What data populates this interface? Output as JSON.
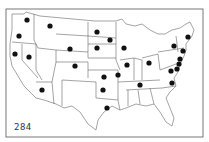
{
  "map": {
    "title": "",
    "figure_number": "284",
    "frame": {
      "x": 6,
      "y": 9,
      "w": 197,
      "h": 128
    },
    "colors": {
      "line": "#555555",
      "dot": "#111111",
      "background": "#ffffff"
    },
    "dots": [
      {
        "region": "washington",
        "x": 27,
        "y": 20
      },
      {
        "region": "oregon",
        "x": 19,
        "y": 36
      },
      {
        "region": "montana-west",
        "x": 50,
        "y": 26
      },
      {
        "region": "california",
        "x": 15,
        "y": 54
      },
      {
        "region": "nevada",
        "x": 29,
        "y": 57
      },
      {
        "region": "arizona",
        "x": 42,
        "y": 90
      },
      {
        "region": "wyoming",
        "x": 70,
        "y": 49
      },
      {
        "region": "colorado",
        "x": 75,
        "y": 66
      },
      {
        "region": "north-dakota",
        "x": 97,
        "y": 32
      },
      {
        "region": "south-dakota",
        "x": 97,
        "y": 48
      },
      {
        "region": "minnesota",
        "x": 110,
        "y": 40
      },
      {
        "region": "wisconsin",
        "x": 124,
        "y": 48
      },
      {
        "region": "illinois",
        "x": 127,
        "y": 65
      },
      {
        "region": "ohio",
        "x": 149,
        "y": 63
      },
      {
        "region": "kansas",
        "x": 104,
        "y": 77
      },
      {
        "region": "missouri",
        "x": 118,
        "y": 75
      },
      {
        "region": "oklahoma",
        "x": 103,
        "y": 90
      },
      {
        "region": "tennessee",
        "x": 140,
        "y": 85
      },
      {
        "region": "louisiana",
        "x": 107,
        "y": 108
      },
      {
        "region": "maine",
        "x": 188,
        "y": 37
      },
      {
        "region": "new-york",
        "x": 174,
        "y": 46
      },
      {
        "region": "massachusetts",
        "x": 183,
        "y": 51
      },
      {
        "region": "new-jersey",
        "x": 180,
        "y": 59
      },
      {
        "region": "delaware",
        "x": 179,
        "y": 64
      },
      {
        "region": "maryland",
        "x": 177,
        "y": 69
      },
      {
        "region": "virginia",
        "x": 171,
        "y": 71
      },
      {
        "region": "north-carolina",
        "x": 172,
        "y": 83
      }
    ]
  }
}
